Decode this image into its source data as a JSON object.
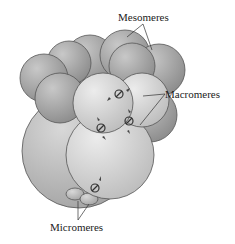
{
  "diagram": {
    "labels": {
      "mesomeres": "Mesomeres",
      "macromeres": "Macromeres",
      "micromeres": "Micromeres"
    },
    "colors": {
      "sphere_dark": "#9a9a9a",
      "sphere_mid": "#b8b8b8",
      "sphere_light": "#d6d6d6",
      "outline": "#555555",
      "background": "#ffffff"
    }
  }
}
